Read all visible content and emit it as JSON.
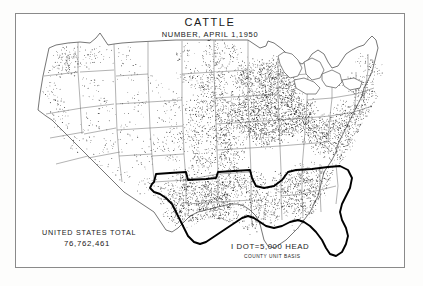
{
  "document": {
    "title": "CATTLE",
    "subtitle": "NUMBER, APRIL 1,1950"
  },
  "legend": {
    "total_label": "UNITED STATES TOTAL",
    "total_value": "76,762,461",
    "dot_value": "I DOT=5,000 HEAD",
    "basis_note": "COUNTY UNIT BASIS"
  },
  "map": {
    "type": "dot-density",
    "region": "contiguous-united-states",
    "projection": "conic",
    "dot_unit_head": 5000,
    "total_head": 76762461,
    "highlight_outline": "southern-states-bold-boundary",
    "frame": {
      "x": 15,
      "y": 13,
      "width": 390,
      "height": 255
    }
  },
  "colors": {
    "ink": "#1a1a1a",
    "paper": "#ffffff",
    "sheet": "#fdfdfc",
    "frame_line": "#8a8a8a",
    "state_line": "#555555",
    "bold_line": "#000000",
    "dot": "#333333"
  }
}
